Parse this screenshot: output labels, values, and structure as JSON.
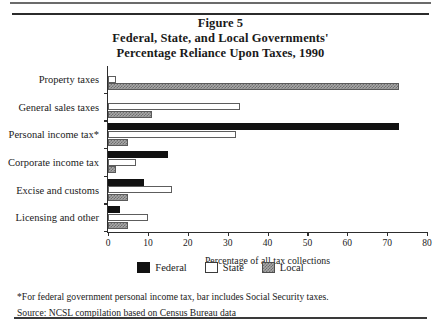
{
  "figure": {
    "title_lines": [
      "Figure 5",
      "Federal, State, and Local Governments'",
      "Percentage Reliance Upon Taxes, 1990"
    ],
    "footnote_asterisk": "*For federal government personal income tax, bar includes Social Security taxes.",
    "source_note": "Source: NCSL compilation based on Census Bureau data"
  },
  "legend": {
    "items": [
      {
        "label": "Federal",
        "color": "#111111",
        "swatch": "solid-black"
      },
      {
        "label": "State",
        "color": "#ffffff",
        "swatch": "open-white"
      },
      {
        "label": "Local",
        "color": "#a8a8a8",
        "swatch": "gray-hatched"
      }
    ]
  },
  "chart_data": {
    "type": "bar",
    "orientation": "horizontal",
    "title": "Federal, State, and Local Governments' Percentage Reliance Upon Taxes, 1990",
    "xlabel": "Percentage of all tax collections",
    "ylabel": "",
    "xlim": [
      0,
      80
    ],
    "xticks": [
      0,
      10,
      20,
      30,
      40,
      50,
      60,
      70,
      80
    ],
    "xtick_labels": [
      "0",
      "10",
      "20",
      "30",
      "40",
      "50",
      "60",
      "70",
      "80"
    ],
    "grid": false,
    "legend_position": "bottom-center",
    "categories": [
      "Property taxes",
      "General sales taxes",
      "Personal income tax*",
      "Corporate income tax",
      "Excise and customs",
      "Licensing and other"
    ],
    "series": [
      {
        "name": "Federal",
        "values": [
          0,
          0,
          73,
          15,
          9,
          3
        ]
      },
      {
        "name": "State",
        "values": [
          2,
          33,
          32,
          7,
          16,
          10
        ]
      },
      {
        "name": "Local",
        "values": [
          73,
          11,
          5,
          2,
          5,
          5
        ]
      }
    ]
  }
}
